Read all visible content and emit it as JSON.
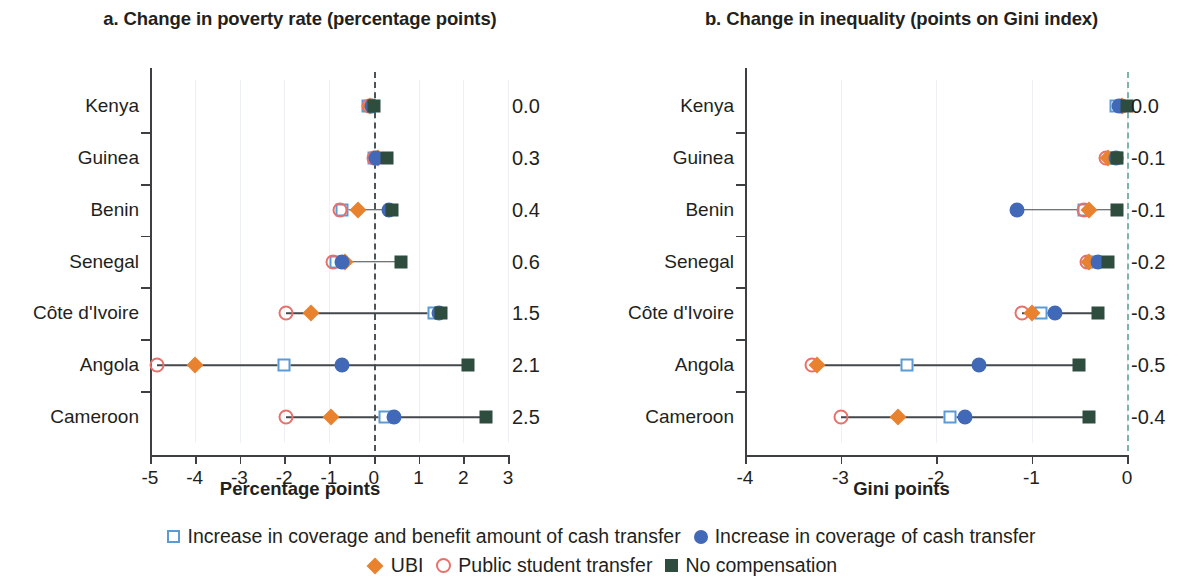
{
  "figure": {
    "panels": [
      {
        "id": "poverty",
        "title": "a. Change in poverty rate (percentage points)",
        "xlabel": "Percentage points"
      },
      {
        "id": "inequality",
        "title": "b. Change in inequality (points on Gini index)",
        "xlabel": "Gini points"
      }
    ]
  },
  "legend": {
    "rows": [
      [
        {
          "marker": "square-open",
          "label": "Increase in coverage and benefit amount of cash transfer"
        },
        {
          "marker": "circle-filled",
          "label": "Increase in coverage of cash transfer"
        }
      ],
      [
        {
          "marker": "diamond",
          "label": "UBI"
        },
        {
          "marker": "circle-open",
          "label": "Public student transfer"
        },
        {
          "marker": "square-filled",
          "label": "No compensation"
        }
      ]
    ]
  },
  "colors": {
    "square_open": "#5b9bd5",
    "circle_filled": "#4169b8",
    "diamond": "#e8822f",
    "circle_open": "#e8706a",
    "square_filled": "#2e4d3f",
    "zero_line_left": "#4b5457",
    "zero_line_right": "#7fb3ad",
    "axis": "#3c4043"
  },
  "chart_data": [
    {
      "type": "scatter",
      "panel": "a",
      "title": "a. Change in poverty rate (percentage points)",
      "xlabel": "Percentage points",
      "ylabel": "",
      "xlim": [
        -5,
        3
      ],
      "xticks": [
        -5,
        -4,
        -3,
        -2,
        -1,
        0,
        1,
        2,
        3
      ],
      "xticklabels": [
        "-5",
        "-4",
        "-3",
        "-2",
        "-1",
        "0",
        "1",
        "2",
        "3"
      ],
      "categories": [
        "Kenya",
        "Guinea",
        "Benin",
        "Senegal",
        "Côte d'Ivoire",
        "Angola",
        "Cameroon"
      ],
      "reference_line": 0,
      "grid": false,
      "legend_position": "bottom",
      "series": [
        {
          "name": "Increase in coverage and benefit amount of cash transfer",
          "marker": "square-open",
          "values": [
            -0.12,
            0.0,
            -0.7,
            -0.85,
            1.35,
            -2.0,
            0.25
          ]
        },
        {
          "name": "Increase in coverage of cash transfer",
          "marker": "circle-filled",
          "values": [
            -0.05,
            0.05,
            0.35,
            -0.7,
            1.45,
            -0.7,
            0.45
          ]
        },
        {
          "name": "UBI",
          "marker": "diamond",
          "values": [
            -0.08,
            0.1,
            -0.35,
            -0.65,
            -1.4,
            -4.0,
            -0.95
          ]
        },
        {
          "name": "Public student transfer",
          "marker": "circle-open",
          "values": [
            -0.1,
            0.0,
            -0.75,
            -0.9,
            -1.95,
            -4.85,
            -1.95
          ]
        },
        {
          "name": "No compensation",
          "marker": "square-filled",
          "values": [
            0.0,
            0.3,
            0.4,
            0.6,
            1.5,
            2.1,
            2.5
          ]
        }
      ],
      "value_labels": [
        "0.0",
        "0.3",
        "0.4",
        "0.6",
        "1.5",
        "2.1",
        "2.5"
      ]
    },
    {
      "type": "scatter",
      "panel": "b",
      "title": "b. Change in inequality (points on Gini index)",
      "xlabel": "Gini points",
      "ylabel": "",
      "xlim": [
        -4,
        0
      ],
      "xticks": [
        -4,
        -3,
        -2,
        -1,
        0
      ],
      "xticklabels": [
        "-4",
        "-3",
        "-2",
        "-1",
        "0"
      ],
      "categories": [
        "Kenya",
        "Guinea",
        "Benin",
        "Senegal",
        "Côte d'Ivoire",
        "Angola",
        "Cameroon"
      ],
      "reference_line": 0,
      "grid": false,
      "legend_position": "bottom",
      "series": [
        {
          "name": "Increase in coverage and benefit amount of cash transfer",
          "marker": "square-open",
          "values": [
            -0.12,
            -0.12,
            -0.45,
            -0.38,
            -0.9,
            -2.3,
            -1.85
          ]
        },
        {
          "name": "Increase in coverage of cash transfer",
          "marker": "circle-filled",
          "values": [
            -0.08,
            -0.12,
            -1.15,
            -0.3,
            -0.75,
            -1.55,
            -1.7
          ]
        },
        {
          "name": "UBI",
          "marker": "diamond",
          "values": [
            -0.05,
            -0.2,
            -0.4,
            -0.4,
            -1.0,
            -3.25,
            -2.4
          ]
        },
        {
          "name": "Public student transfer",
          "marker": "circle-open",
          "values": [
            -0.05,
            -0.22,
            -0.45,
            -0.42,
            -1.1,
            -3.3,
            -3.0
          ]
        },
        {
          "name": "No compensation",
          "marker": "square-filled",
          "values": [
            0.0,
            -0.1,
            -0.1,
            -0.2,
            -0.3,
            -0.5,
            -0.4
          ]
        }
      ],
      "value_labels": [
        "0.0",
        "-0.1",
        "-0.1",
        "-0.2",
        "-0.3",
        "-0.5",
        "-0.4"
      ]
    }
  ]
}
